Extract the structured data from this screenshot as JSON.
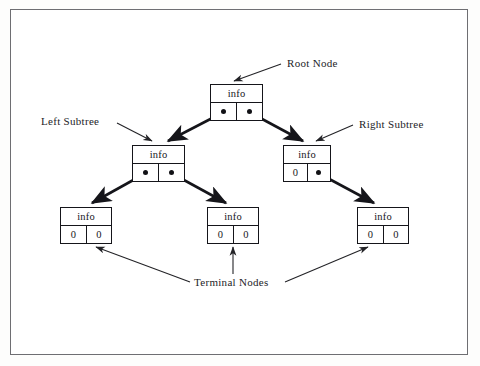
{
  "diagram": {
    "colors": {
      "ink": "#15151a",
      "frame": "#6e6e72",
      "background": "#ffffff"
    },
    "nodes": [
      {
        "id": "root",
        "info": "info",
        "left_cell": "",
        "right_cell": "",
        "left_is_pointer": true,
        "right_is_pointer": true
      },
      {
        "id": "left",
        "info": "info",
        "left_cell": "",
        "right_cell": "",
        "left_is_pointer": true,
        "right_is_pointer": true
      },
      {
        "id": "right",
        "info": "info",
        "left_cell": "0",
        "right_cell": "",
        "left_is_pointer": false,
        "right_is_pointer": true
      },
      {
        "id": "terminal1",
        "info": "info",
        "left_cell": "0",
        "right_cell": "0",
        "left_is_pointer": false,
        "right_is_pointer": false
      },
      {
        "id": "terminal2",
        "info": "info",
        "left_cell": "0",
        "right_cell": "0",
        "left_is_pointer": false,
        "right_is_pointer": false
      },
      {
        "id": "terminal3",
        "info": "info",
        "left_cell": "0",
        "right_cell": "0",
        "left_is_pointer": false,
        "right_is_pointer": false
      }
    ],
    "labels": {
      "root_node": "Root Node",
      "left_subtree": "Left Subtree",
      "right_subtree": "Right Subtree",
      "terminal_nodes": "Terminal Nodes"
    }
  }
}
